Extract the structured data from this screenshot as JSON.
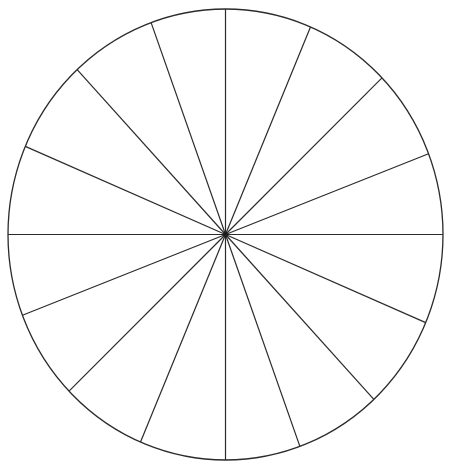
{
  "figure": {
    "kind": "sector-divided-circle",
    "title": "Circle divided into equal sectors",
    "background_color": "#ffffff",
    "canvas": {
      "width": 451,
      "height": 466
    },
    "circle": {
      "center_x": 225.5,
      "center_y": 234.5,
      "radius_x": 217.5,
      "radius_y": 225.5,
      "stroke_color": "#2b2b2b",
      "stroke_width": 1.3,
      "fill_color": "#ffffff"
    },
    "sectors": {
      "count": 16,
      "nominal_angle_deg": 22.5,
      "divider_stroke_color": "#2b2b2b",
      "divider_stroke_width": 1.2,
      "boundary_angles_deg": [
        0,
        21,
        44,
        67,
        90,
        110,
        133,
        157,
        180,
        201,
        224,
        247,
        270,
        290,
        313,
        337
      ]
    },
    "center_dot": {
      "radius": 2.4,
      "color": "#1a1a1a"
    }
  }
}
